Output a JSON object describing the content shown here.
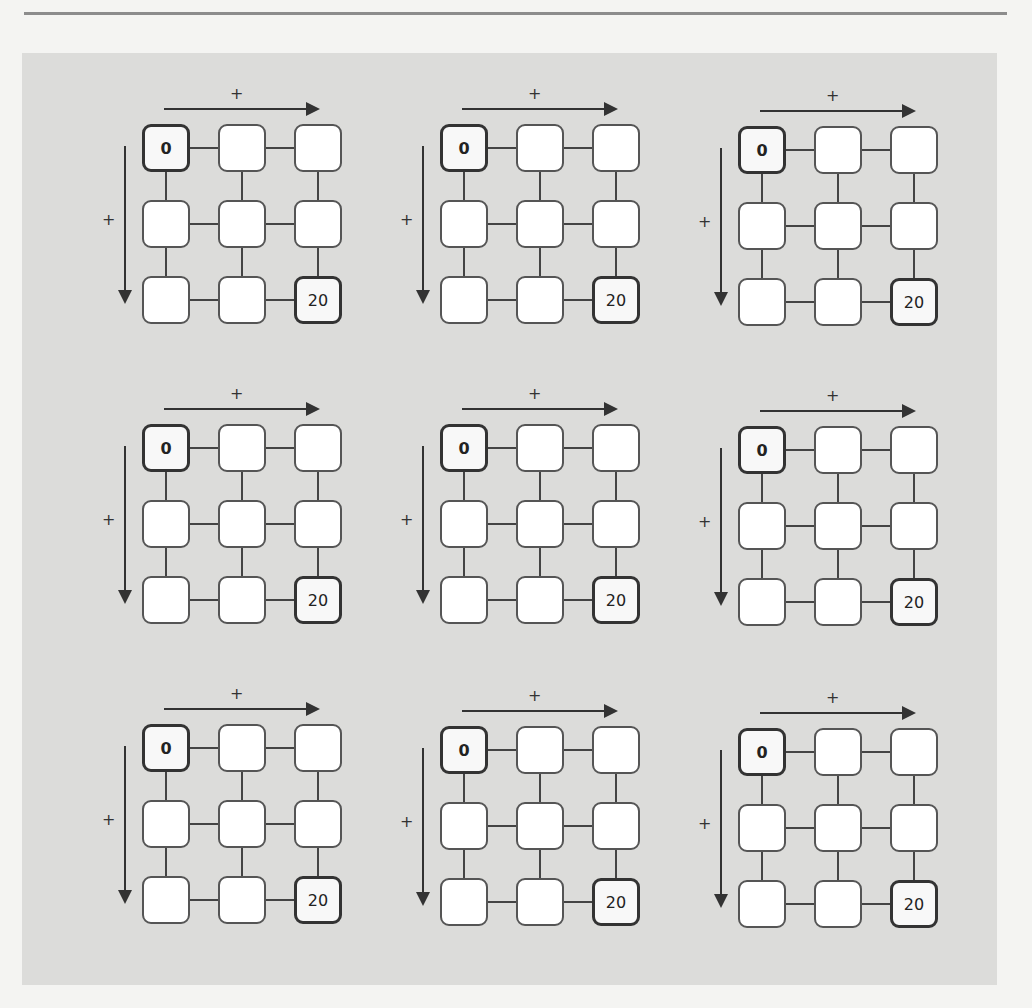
{
  "page": {
    "background": "#f4f4f2",
    "panel_color": "#dcdcda"
  },
  "puzzle": {
    "rows_of_grids": 3,
    "cols_of_grids": 3,
    "horizontal_arrow_label": "+",
    "vertical_arrow_label": "+",
    "grids": [
      {
        "cells": [
          "0",
          "",
          "",
          "",
          "",
          "",
          "",
          "",
          "20"
        ]
      },
      {
        "cells": [
          "0",
          "",
          "",
          "",
          "",
          "",
          "",
          "",
          "20"
        ]
      },
      {
        "cells": [
          "0",
          "",
          "",
          "",
          "",
          "",
          "",
          "",
          "20"
        ]
      },
      {
        "cells": [
          "0",
          "",
          "",
          "",
          "",
          "",
          "",
          "",
          "20"
        ]
      },
      {
        "cells": [
          "0",
          "",
          "",
          "",
          "",
          "",
          "",
          "",
          "20"
        ]
      },
      {
        "cells": [
          "0",
          "",
          "",
          "",
          "",
          "",
          "",
          "",
          "20"
        ]
      },
      {
        "cells": [
          "0",
          "",
          "",
          "",
          "",
          "",
          "",
          "",
          "20"
        ]
      },
      {
        "cells": [
          "0",
          "",
          "",
          "",
          "",
          "",
          "",
          "",
          "20"
        ]
      },
      {
        "cells": [
          "0",
          "",
          "",
          "",
          "",
          "",
          "",
          "",
          "20"
        ]
      }
    ]
  }
}
